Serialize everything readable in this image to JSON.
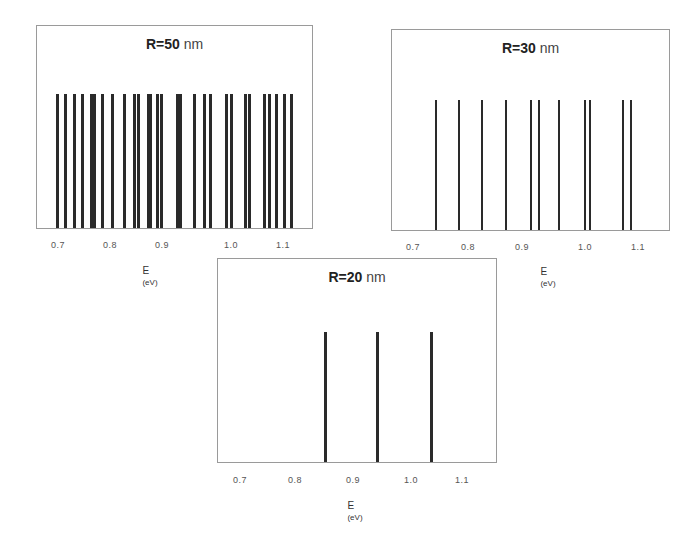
{
  "chart_data": [
    {
      "type": "bar",
      "subtype": "stick spectrum (energy levels)",
      "title": "R=50 nm",
      "xlabel": "E (eV)",
      "ylabel": "",
      "xlim": [
        0.66,
        1.16
      ],
      "xticks": [
        "0.7",
        "0.8",
        "0.9",
        "1.0",
        "1.1"
      ],
      "grid": false,
      "legend": null,
      "x": [
        0.698,
        0.711,
        0.727,
        0.741,
        0.757,
        0.763,
        0.777,
        0.795,
        0.816,
        0.834,
        0.841,
        0.859,
        0.862,
        0.875,
        0.882,
        0.911,
        0.916,
        0.941,
        0.959,
        0.97,
        0.998,
        1.007,
        1.032,
        1.039,
        1.066,
        1.075,
        1.086,
        1.101,
        1.114
      ],
      "values": [
        1,
        1,
        1,
        1,
        1,
        1,
        1,
        1,
        1,
        1,
        1,
        1,
        1,
        1,
        1,
        1,
        1,
        1,
        1,
        1,
        1,
        1,
        1,
        1,
        1,
        1,
        1,
        1,
        1
      ]
    },
    {
      "type": "bar",
      "subtype": "stick spectrum (energy levels)",
      "title": "R=30 nm",
      "xlabel": "E (eV)",
      "ylabel": "",
      "xlim": [
        0.66,
        1.16
      ],
      "xticks": [
        "0.7",
        "0.8",
        "0.9",
        "1.0",
        "1.1"
      ],
      "grid": false,
      "legend": null,
      "x": [
        0.739,
        0.78,
        0.821,
        0.864,
        0.908,
        0.922,
        0.958,
        1.004,
        1.013,
        1.072,
        1.086
      ],
      "values": [
        1,
        1,
        1,
        1,
        1,
        1,
        1,
        1,
        1,
        1,
        1
      ]
    },
    {
      "type": "bar",
      "subtype": "stick spectrum (energy levels)",
      "title": "R=20 nm",
      "xlabel": "E (eV)",
      "ylabel": "",
      "xlim": [
        0.66,
        1.16
      ],
      "xticks": [
        "0.7",
        "0.8",
        "0.9",
        "1.0",
        "1.1"
      ],
      "grid": false,
      "legend": null,
      "x": [
        0.853,
        0.946,
        1.044
      ],
      "values": [
        1,
        1,
        1
      ]
    }
  ],
  "panels": [
    {
      "title_r": "R=50",
      "title_unit": " nm",
      "xlabel_main": "E ",
      "xlabel_unit": "(eV)",
      "ticks": [
        "0.7",
        "0.8",
        "0.9",
        "1.0",
        "1.1"
      ]
    },
    {
      "title_r": "R=30",
      "title_unit": " nm",
      "xlabel_main": "E ",
      "xlabel_unit": "(eV)",
      "ticks": [
        "0.7",
        "0.8",
        "0.9",
        "1.0",
        "1.1"
      ]
    },
    {
      "title_r": "R=20",
      "title_unit": " nm",
      "xlabel_main": "E ",
      "xlabel_unit": "(eV)",
      "ticks": [
        "0.7",
        "0.8",
        "0.9",
        "1.0",
        "1.1"
      ]
    }
  ]
}
